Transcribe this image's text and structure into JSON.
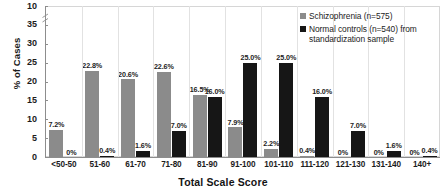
{
  "chart_data": {
    "type": "bar",
    "title": "",
    "subtitle": "",
    "xlabel": "Total Scale Score",
    "ylabel": "% of Cases",
    "ylim": [
      0,
      40
    ],
    "yticks": [
      0,
      5,
      10,
      15,
      20,
      25,
      30,
      35,
      40
    ],
    "ytick_labels": [
      "0",
      "5",
      "10",
      "15",
      "20",
      "25",
      "30",
      "35",
      "10"
    ],
    "grid": false,
    "axis_break": true,
    "legend_position": "top-right",
    "categories": [
      "<50-50",
      "51-60",
      "61-70",
      "71-80",
      "81-90",
      "91-100",
      "101-110",
      "111-120",
      "121-130",
      "131-140",
      "140+"
    ],
    "series": [
      {
        "name": "Schizophrenia (n=575)",
        "color": "#8b8b8b",
        "values": [
          7.2,
          22.8,
          20.6,
          22.6,
          16.5,
          7.9,
          2.2,
          0.4,
          0.0,
          0.0,
          0.0
        ],
        "labels": [
          "7.2%",
          "22.8%",
          "20.6%",
          "22.6%",
          "16.5%",
          "7.9%",
          "2.2%",
          "0.4%",
          "0%",
          "0%",
          "0%"
        ]
      },
      {
        "name": "Normal controls (n=540) from standardization sample",
        "color": "#161616",
        "values": [
          0.0,
          0.4,
          1.6,
          7.0,
          16.0,
          25.0,
          25.0,
          16.0,
          7.0,
          1.6,
          0.4
        ],
        "labels": [
          "0%",
          "0.4%",
          "1.6%",
          "7.0%",
          "16.0%",
          "25.0%",
          "25.0%",
          "16.0%",
          "7.0%",
          "1.6%",
          "0.4%"
        ]
      }
    ]
  },
  "legend": {
    "entries": [
      {
        "label": "Schizophrenia (n=575)",
        "color": "#8b8b8b"
      },
      {
        "label": "Normal controls (n=540) from standardization sample",
        "color": "#161616"
      }
    ]
  },
  "axes": {
    "y_title": "% of Cases",
    "x_title": "Total Scale Score"
  }
}
